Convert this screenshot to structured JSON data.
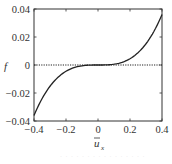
{
  "chart_data": {
    "type": "line",
    "title": "",
    "xlabel": "ū_x",
    "ylabel": "f",
    "xlim": [
      -0.4,
      0.4
    ],
    "ylim": [
      -0.04,
      0.04
    ],
    "xticks": [
      -0.4,
      -0.2,
      0,
      0.2,
      0.4
    ],
    "yticks": [
      -0.04,
      -0.02,
      0,
      0.02,
      0.04
    ],
    "xtick_labels": [
      "−0.4",
      "−0.2",
      "0",
      "0.2",
      "0.4"
    ],
    "ytick_labels": [
      "−0.04",
      "−0.02",
      "0",
      "0.02",
      "0.04"
    ],
    "grid": false,
    "legend": null,
    "series": [
      {
        "name": "f",
        "style": "solid",
        "color": "#222222",
        "x": [
          -0.4,
          -0.35,
          -0.3,
          -0.25,
          -0.2,
          -0.15,
          -0.1,
          -0.05,
          0,
          0.05,
          0.1,
          0.15,
          0.2,
          0.25,
          0.3,
          0.35,
          0.4
        ],
        "values": [
          -0.036,
          -0.0241,
          -0.0152,
          -0.0088,
          -0.0045,
          -0.0019,
          -0.0006,
          -0.0001,
          0,
          0.0001,
          0.0006,
          0.0019,
          0.0045,
          0.0088,
          0.0152,
          0.0241,
          0.036
        ]
      },
      {
        "name": "zero reference",
        "style": "dotted",
        "color": "#222222",
        "x": [
          -0.4,
          0.4
        ],
        "values": [
          0,
          0
        ]
      }
    ]
  },
  "labels": {
    "ylabel": "f",
    "xlabel_base": "u",
    "xlabel_sub": "x",
    "caption": "· · · · · · · ·   · · · · · · · ·"
  },
  "colors": {
    "curve": "#222222",
    "frame": "#333333",
    "text": "#333333"
  }
}
